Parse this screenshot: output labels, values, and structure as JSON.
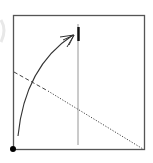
{
  "diagram": {
    "colors": {
      "frame": "#555555",
      "vertical_line": "#888888",
      "marker": "#111111",
      "arrow": "#333333",
      "diagonal": "#444444",
      "origin_dot": "#000000",
      "ghost_arc": "#e6e6e6"
    },
    "elements": [
      {
        "name": "frame",
        "kind": "rectangle"
      },
      {
        "name": "vertical-reference-line",
        "kind": "line"
      },
      {
        "name": "vertical-marker",
        "kind": "thick-segment"
      },
      {
        "name": "curved-arrow",
        "kind": "arc-with-open-arrowhead"
      },
      {
        "name": "diagonal-dashed-segment",
        "kind": "dashed-line"
      },
      {
        "name": "diagonal-dotted-segment",
        "kind": "dotted-line"
      },
      {
        "name": "origin-dot",
        "kind": "point"
      }
    ]
  }
}
